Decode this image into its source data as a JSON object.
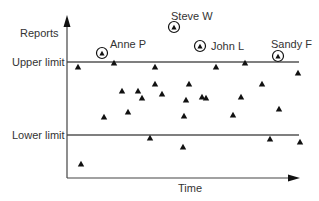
{
  "chart_data": {
    "type": "scatter",
    "title": "",
    "xlabel": "Time",
    "ylabel": "Reports",
    "grid": false,
    "legend": null,
    "reference_lines": [
      {
        "name": "upper-limit",
        "label": "Upper limit",
        "y_px": 62
      },
      {
        "name": "lower-limit",
        "label": "Lower limit",
        "y_px": 135
      }
    ],
    "axes": {
      "origin_px": [
        67,
        178
      ],
      "y_top_px": 17,
      "x_right_px": 298
    },
    "points": [
      {
        "x": 78,
        "y": 67
      },
      {
        "x": 114,
        "y": 63
      },
      {
        "x": 155,
        "y": 67
      },
      {
        "x": 216,
        "y": 67
      },
      {
        "x": 245,
        "y": 63
      },
      {
        "x": 298,
        "y": 73
      },
      {
        "x": 155,
        "y": 84
      },
      {
        "x": 189,
        "y": 84
      },
      {
        "x": 262,
        "y": 84
      },
      {
        "x": 122,
        "y": 91
      },
      {
        "x": 138,
        "y": 91
      },
      {
        "x": 142,
        "y": 98
      },
      {
        "x": 162,
        "y": 94
      },
      {
        "x": 202,
        "y": 97
      },
      {
        "x": 206,
        "y": 98
      },
      {
        "x": 241,
        "y": 97
      },
      {
        "x": 279,
        "y": 109
      },
      {
        "x": 104,
        "y": 117
      },
      {
        "x": 128,
        "y": 112
      },
      {
        "x": 184,
        "y": 116
      },
      {
        "x": 233,
        "y": 115
      },
      {
        "x": 150,
        "y": 138
      },
      {
        "x": 270,
        "y": 139
      },
      {
        "x": 300,
        "y": 142
      },
      {
        "x": 183,
        "y": 147
      },
      {
        "x": 81,
        "y": 164
      },
      {
        "x": 186,
        "y": 100
      }
    ],
    "highlighted_points": [
      {
        "name": "Anne P",
        "x": 102,
        "y": 53
      },
      {
        "name": "Steve W",
        "x": 174,
        "y": 27
      },
      {
        "name": "John L",
        "x": 200,
        "y": 46
      },
      {
        "name": "Sandy F",
        "x": 278,
        "y": 56
      }
    ]
  },
  "labels": {
    "y_axis": "Reports",
    "x_axis": "Time",
    "upper_limit": "Upper limit",
    "lower_limit": "Lower limit",
    "anne": "Anne P",
    "steve": "Steve W",
    "john": "John L",
    "sandy": "Sandy F"
  },
  "colors": {
    "axis": "#222222",
    "limit_line": "#555555",
    "marker": "#111111"
  }
}
